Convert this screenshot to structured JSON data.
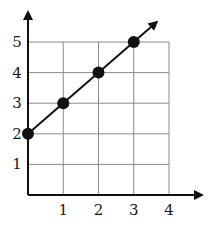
{
  "chart_data": {
    "type": "line",
    "title": "",
    "xlabel": "",
    "ylabel": "",
    "xlim": [
      0,
      4
    ],
    "ylim": [
      0,
      5
    ],
    "grid": true,
    "x_ticks": [
      "1",
      "2",
      "3",
      "4"
    ],
    "y_ticks": [
      "1",
      "2",
      "3",
      "4",
      "5"
    ],
    "series": [
      {
        "name": "line",
        "x": [
          0,
          1,
          2,
          3
        ],
        "y": [
          2,
          3,
          4,
          5
        ],
        "markers": true,
        "arrow_end": true
      }
    ],
    "colors": {
      "line": "#111111",
      "grid": "#8a8a8a",
      "axis": "#111111"
    }
  }
}
